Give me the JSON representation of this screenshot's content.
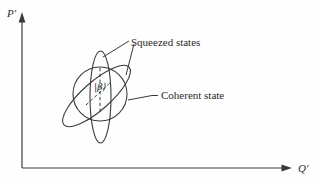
{
  "figure": {
    "axes": {
      "y_label": "P′",
      "x_label": "Q′"
    },
    "labels": {
      "squeezed_states": "Squeezed states",
      "coherent_state": "Coherent state",
      "center_ket": "|β⟩"
    },
    "colors": {
      "line": "#3b3b3b",
      "text": "#2a2a2a",
      "background": "#fefefe"
    }
  }
}
